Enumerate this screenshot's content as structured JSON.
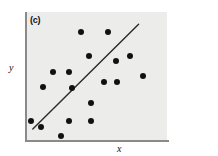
{
  "figure": {
    "panel_label": "(c)",
    "background_color": "#ffffff",
    "plot_background_color": "#ececeb",
    "axis_color": "#8a8a8a",
    "point_color": "#111111",
    "line_color": "#2a2a2a"
  },
  "chart_data": {
    "type": "scatter",
    "title": "(c)",
    "xlabel": "x",
    "ylabel": "y",
    "grid": false,
    "legend": null,
    "xlim": [
      0,
      1
    ],
    "ylim": [
      0,
      1
    ],
    "axis_ticks": {
      "x": [],
      "y": []
    },
    "series": [
      {
        "name": "observations",
        "marker": "filled-circle",
        "points": [
          {
            "x": 0.395,
            "y": 0.845
          },
          {
            "x": 0.585,
            "y": 0.845
          },
          {
            "x": 0.45,
            "y": 0.66
          },
          {
            "x": 0.64,
            "y": 0.62
          },
          {
            "x": 0.74,
            "y": 0.655
          },
          {
            "x": 0.195,
            "y": 0.53
          },
          {
            "x": 0.31,
            "y": 0.535
          },
          {
            "x": 0.83,
            "y": 0.5
          },
          {
            "x": 0.555,
            "y": 0.455
          },
          {
            "x": 0.645,
            "y": 0.455
          },
          {
            "x": 0.13,
            "y": 0.415
          },
          {
            "x": 0.33,
            "y": 0.41
          },
          {
            "x": 0.465,
            "y": 0.29
          },
          {
            "x": 0.04,
            "y": 0.15
          },
          {
            "x": 0.11,
            "y": 0.105
          },
          {
            "x": 0.31,
            "y": 0.15
          },
          {
            "x": 0.465,
            "y": 0.15
          },
          {
            "x": 0.255,
            "y": 0.03
          }
        ]
      }
    ],
    "fit_line": {
      "name": "regression-line",
      "x_start": 0.055,
      "y_start": 0.085,
      "x_end": 0.8,
      "y_end": 0.905
    }
  }
}
